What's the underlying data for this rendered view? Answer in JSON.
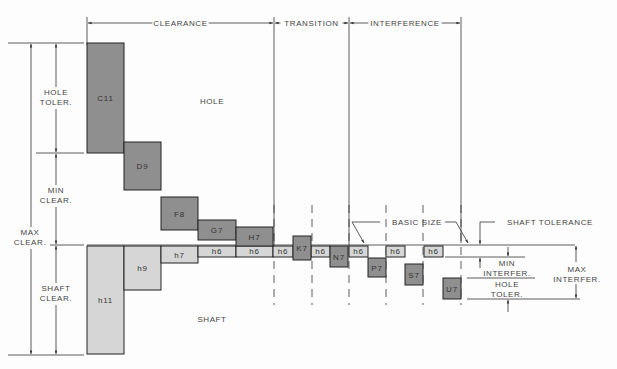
{
  "zones": [
    {
      "label": "CLEARANCE",
      "x1": 87,
      "x2": 274
    },
    {
      "label": "TRANSITION",
      "x1": 274,
      "x2": 349
    },
    {
      "label": "INTERFERENCE",
      "x1": 349,
      "x2": 461
    }
  ],
  "regions": {
    "hole": "HOLE",
    "shaft": "SHAFT"
  },
  "left_dims": {
    "hole_toler": [
      "HOLE",
      "TOLER."
    ],
    "min_clear": [
      "MIN",
      "CLEAR."
    ],
    "max_clear": [
      "MAX",
      "CLEAR."
    ],
    "shaft_clear": [
      "SHAFT",
      "CLEAR."
    ]
  },
  "right_dims": {
    "basic_size": "BASIC SIZE",
    "shaft_tolerance": "SHAFT TOLERANCE",
    "min_interfer": [
      "MIN",
      "INTERFER."
    ],
    "hole_toler": [
      "HOLE",
      "TOLER."
    ],
    "max_interfer": [
      "MAX",
      "INTERFER."
    ]
  },
  "colors": {
    "hole_fill": "#8f8f8f",
    "shaft_fill": "#d6d6d6",
    "line": "#333333"
  },
  "hole_boxes": [
    {
      "label": "C11",
      "x": 87,
      "y": 43,
      "w": 37,
      "h": 110
    },
    {
      "label": "D9",
      "x": 124,
      "y": 142,
      "w": 37,
      "h": 48
    },
    {
      "label": "F8",
      "x": 161,
      "y": 197,
      "w": 37,
      "h": 33
    },
    {
      "label": "G7",
      "x": 198,
      "y": 220,
      "w": 38,
      "h": 20
    },
    {
      "label": "H7",
      "x": 236,
      "y": 227,
      "w": 37,
      "h": 19
    },
    {
      "label": "K7",
      "x": 293,
      "y": 236,
      "w": 18,
      "h": 24
    },
    {
      "label": "N7",
      "x": 330,
      "y": 246,
      "w": 18,
      "h": 21
    },
    {
      "label": "P7",
      "x": 368,
      "y": 258,
      "w": 18,
      "h": 19
    },
    {
      "label": "S7",
      "x": 405,
      "y": 264,
      "w": 18,
      "h": 21
    },
    {
      "label": "U7",
      "x": 443,
      "y": 278,
      "w": 18,
      "h": 21
    }
  ],
  "shaft_boxes": [
    {
      "label": "h11",
      "x": 87,
      "y": 246,
      "w": 37,
      "h": 108
    },
    {
      "label": "h9",
      "x": 124,
      "y": 246,
      "w": 37,
      "h": 44
    },
    {
      "label": "h7",
      "x": 161,
      "y": 246,
      "w": 37,
      "h": 17
    },
    {
      "label": "h6",
      "x": 198,
      "y": 246,
      "w": 38,
      "h": 11
    },
    {
      "label": "h6",
      "x": 236,
      "y": 246,
      "w": 37,
      "h": 11
    },
    {
      "label": "h6",
      "x": 273,
      "y": 246,
      "w": 20,
      "h": 11
    },
    {
      "label": "h6",
      "x": 311,
      "y": 246,
      "w": 19,
      "h": 11
    },
    {
      "label": "h6",
      "x": 349,
      "y": 246,
      "w": 19,
      "h": 11
    },
    {
      "label": "h6",
      "x": 386,
      "y": 246,
      "w": 19,
      "h": 11
    },
    {
      "label": "h6",
      "x": 424,
      "y": 246,
      "w": 19,
      "h": 11
    }
  ]
}
